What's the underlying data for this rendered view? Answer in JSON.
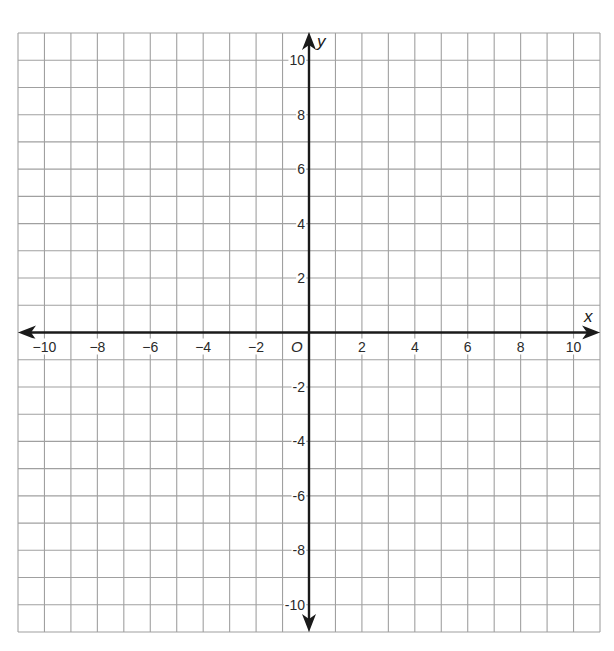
{
  "chart_data": {
    "type": "scatter",
    "title": "",
    "xlabel": "x",
    "ylabel": "y",
    "origin_label": "O",
    "xlim": [
      -11,
      11
    ],
    "ylim": [
      -11,
      11
    ],
    "grid": true,
    "grid_step": 1,
    "x_tick_values": [
      -10,
      -8,
      -6,
      -4,
      -2,
      2,
      4,
      6,
      8,
      10
    ],
    "x_tick_labels": [
      "−10",
      "−8",
      "−6",
      "−4",
      "−2",
      "2",
      "4",
      "6",
      "8",
      "10"
    ],
    "y_tick_values": [
      10,
      8,
      6,
      4,
      2,
      -2,
      -4,
      -6,
      -8,
      -10
    ],
    "y_tick_labels": [
      "10",
      "8",
      "6",
      "4",
      "2",
      "-2",
      "-4",
      "-6",
      "-8",
      "-10"
    ],
    "series": []
  },
  "layout": {
    "grid_left": 18,
    "grid_top": 33,
    "grid_right": 600,
    "grid_bottom": 632
  },
  "colors": {
    "grid": "#a0a0a0",
    "axis": "#1a1a1a",
    "text": "#2a2a2a",
    "background": "#ffffff"
  }
}
